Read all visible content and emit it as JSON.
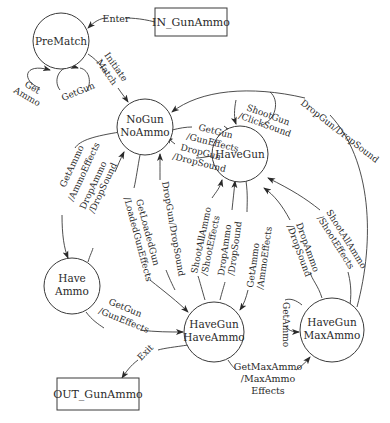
{
  "diagram": {
    "type": "state-machine",
    "terminals": {
      "in": {
        "label": "IN_GunAmmo"
      },
      "out": {
        "label": "OUT_GunAmmo"
      }
    },
    "states": {
      "prematch": {
        "label": "PreMatch"
      },
      "nogun_noammo": {
        "line1": "NoGun",
        "line2": "NoAmmo"
      },
      "havegun": {
        "label": "HaveGun"
      },
      "haveammo": {
        "line1": "Have",
        "line2": "Ammo"
      },
      "havegun_haveammo": {
        "line1": "HaveGun",
        "line2": "HaveAmmo"
      },
      "havegun_maxammo": {
        "line1": "HaveGun",
        "line2": "MaxAmmo"
      }
    },
    "transitions": {
      "enter": "Enter",
      "prematch_getammo_1": "Get",
      "prematch_getammo_2": "Ammo",
      "prematch_getgun": "GetGun",
      "initiate_1": "Initiate",
      "initiate_2": "Match",
      "nogun_to_havegun_1": "GetGun",
      "nogun_to_havegun_2": "/GunEffects",
      "havegun_to_nogun_1": "DropGun",
      "havegun_to_nogun_2": "/DropSound",
      "shootgun_1": "ShootGun",
      "shootgun_2": "/ClickSound",
      "maxammo_to_nogun": "DropGun/DropSound",
      "nogun_to_haveammo_1": "GetAmmo",
      "nogun_to_haveammo_2": "/AmmoEffects",
      "haveammo_to_nogun_1": "DropAmmo",
      "haveammo_to_nogun_2": "/DropSound",
      "nogun_to_hgha_1": "GetLoadedGun",
      "nogun_to_hgha_2": "/LoadedGunEffects",
      "hgha_to_nogun": "DropGun/DropSound",
      "hgha_to_havegun_shoot_1": "ShootAllAmmo",
      "hgha_to_havegun_shoot_2": "/ShootEffects",
      "hgha_to_havegun_drop_1": "DropAmmo",
      "hgha_to_havegun_drop_2": "/DropSound",
      "havegun_to_hgha_1": "GetAmmo",
      "havegun_to_hgha_2": "/AmmoEffects",
      "maxammo_to_havegun_drop_1": "DropAmmo",
      "maxammo_to_havegun_drop_2": "/DropSound",
      "maxammo_to_havegun_shoot_1": "ShootAllAmmo",
      "maxammo_to_havegun_shoot_2": "/ShootEffects",
      "haveammo_to_hgha_1": "GetGun",
      "haveammo_to_hgha_2": "/GunEffects",
      "maxammo_self": "GetAmmo",
      "hgha_to_maxammo_1": "GetMaxAmmo",
      "hgha_to_maxammo_2": "/MaxAmmo",
      "hgha_to_maxammo_3": "Effects",
      "exit": "Exit"
    }
  }
}
